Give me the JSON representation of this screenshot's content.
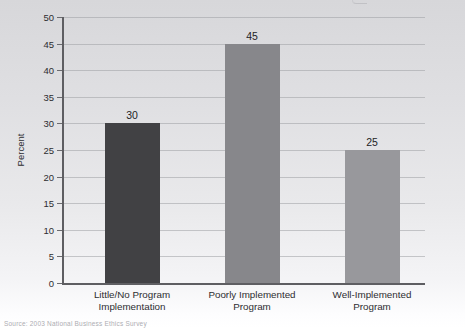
{
  "chart_data": {
    "type": "bar",
    "categories": [
      "Little/No Program Implementation",
      "Poorly Implemented Program",
      "Well-Implemented Program"
    ],
    "categories_wrapped": [
      [
        "Little/No Program",
        "Implementation"
      ],
      [
        "Poorly Implemented",
        "Program"
      ],
      [
        "Well-Implemented",
        "Program"
      ]
    ],
    "values": [
      30,
      45,
      25
    ],
    "value_labels": [
      "30",
      "45",
      "25"
    ],
    "title": "",
    "xlabel": "",
    "ylabel": "Percent",
    "ylim": [
      0,
      50
    ],
    "ytick_step": 5,
    "ytick_labels": [
      "0",
      "5",
      "10",
      "15",
      "20",
      "25",
      "30",
      "35",
      "40",
      "45",
      "50"
    ],
    "grid": true,
    "legend": "none",
    "bar_colors": [
      "#414144",
      "#87878b",
      "#98989c"
    ],
    "axis_color": "#5e5e62",
    "grid_color": "#9fa0a4",
    "bar_width_px": 55,
    "bar_centers_px": [
      68,
      188,
      308
    ]
  },
  "source_note": "Source: 2003 National Business Ethics Survey"
}
